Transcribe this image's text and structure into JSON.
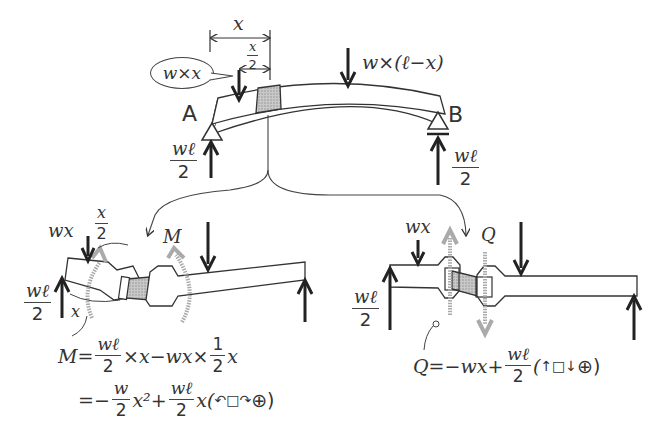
{
  "top_diagram": {
    "dim_x": "x",
    "dim_x_half_num": "x",
    "dim_x_half_den": "2",
    "load_left": "w×x",
    "load_right": "w×(ℓ−x)",
    "support_a": "A",
    "support_b": "B",
    "reaction_a_num": "wℓ",
    "reaction_a_den": "2",
    "reaction_b_num": "wℓ",
    "reaction_b_den": "2"
  },
  "moment_diagram": {
    "load_label": "wx",
    "half_num": "x",
    "half_den": "2",
    "moment_label": "M",
    "reaction_num": "wℓ",
    "reaction_den": "2",
    "x_label": "x",
    "eq1": {
      "lhs": "M=",
      "f1_num": "wℓ",
      "f1_den": "2",
      "mid": "×x−wx×",
      "f2_num": "1",
      "f2_den": "2",
      "tail": "x"
    },
    "eq2": {
      "lhs": "=−",
      "f1_num": "w",
      "f1_den": "2",
      "mid": "x²+",
      "f2_num": "wℓ",
      "f2_den": "2",
      "tail": "x(",
      "sign_icon": "↶□↷",
      "sign": "⊕)"
    }
  },
  "shear_diagram": {
    "load_label": "wx",
    "shear_label": "Q",
    "reaction_num": "wℓ",
    "reaction_den": "2",
    "eq": {
      "lhs": "Q=−wx+",
      "f_num": "wℓ",
      "f_den": "2",
      "tail": "(",
      "sign_icon": "↑□↓",
      "sign": "⊕)"
    }
  },
  "colors": {
    "line": "#333333",
    "hatch_fill": "#b8b8b8",
    "ghost_arrow": "#a8a8a8"
  }
}
